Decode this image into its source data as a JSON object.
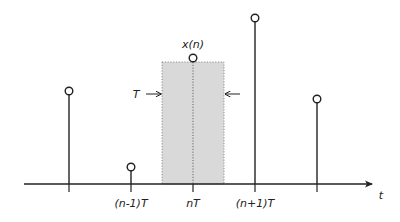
{
  "diagram": {
    "axis": {
      "label": "t",
      "y": 184,
      "x_start": 24,
      "x_end": 372
    },
    "colors": {
      "line": "#222222",
      "shade": "#d9d9d9",
      "dotted": "#666666",
      "background": "#ffffff"
    },
    "samples": [
      {
        "id": "s0",
        "x": 69,
        "top": 91,
        "tick_label": ""
      },
      {
        "id": "s1",
        "x": 131,
        "top": 167,
        "tick_label": "(n-1)T"
      },
      {
        "id": "s2",
        "x": 193,
        "top": 58,
        "tick_label": "nT",
        "value_label": "x(n)"
      },
      {
        "id": "s3",
        "x": 255,
        "top": 18,
        "tick_label": "(n+1)T"
      },
      {
        "id": "s4",
        "x": 317,
        "top": 99,
        "tick_label": ""
      }
    ],
    "shaded_interval": {
      "x0": 162,
      "x1": 224,
      "top": 62,
      "width_label": "T"
    },
    "labels": {
      "value": "x(n)",
      "tick_n_minus_1": "(n-1)T",
      "tick_n": "nT",
      "tick_n_plus_1": "(n+1)T",
      "axis_t": "t",
      "interval_T": "T"
    }
  }
}
